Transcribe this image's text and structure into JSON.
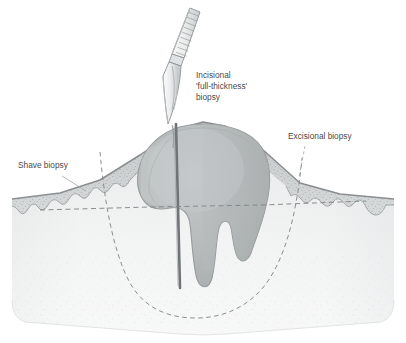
{
  "figure": {
    "background_color": "#ffffff"
  },
  "labels": {
    "incisional": {
      "line1": "Incisional",
      "line2": "'full-thickness'",
      "line3": "biopsy",
      "x": 196,
      "y": 78
    },
    "excisional": {
      "text": "Excisional biopsy",
      "x": 288,
      "y": 139
    },
    "shave": {
      "text": "Shave biopsy",
      "x": 18,
      "y": 168
    }
  },
  "colors": {
    "text": "#4a4a4a",
    "outline": "#8a8e90",
    "epidermis_fill": "#c9cccd",
    "epidermis_stipple": "#9aa0a2",
    "dermis_top": "#dcdedf",
    "dermis_bottom": "#fdfdfd",
    "tumor_fill": "#b9bdbe",
    "tumor_dark": "#a9aeaf",
    "tumor_outline": "#949899",
    "incision_line": "#6f7476",
    "dashed_line": "#7d8284",
    "blade_fill": "#e8eaea",
    "blade_shade": "#c4c8c9",
    "blade_outline": "#8d9193"
  },
  "elements": {
    "scalpel": {
      "name": "scalpel-blade",
      "description": "surgical scalpel angled down-left with ribbed handle top",
      "tip_x": 168,
      "tip_y": 124,
      "handle_ribs": 9
    },
    "tumor": {
      "name": "tumor-mass",
      "description": "rounded melanoma mass with two finger-like projections descending into dermis",
      "projections": 2
    },
    "shave_plane": {
      "name": "shave-biopsy-dashed-line",
      "description": "horizontal dashed line across the epidermis indicating shave plane",
      "y": 207
    },
    "excisional_margin": {
      "name": "excisional-biopsy-dashed-curve",
      "description": "deep U-shaped dashed curve enclosing the whole lesion",
      "depth_y": 311
    },
    "incision": {
      "name": "incisional-biopsy-cut-line",
      "description": "vertical cut line from blade tip through tumor into dermis",
      "bottom_y": 288
    }
  }
}
